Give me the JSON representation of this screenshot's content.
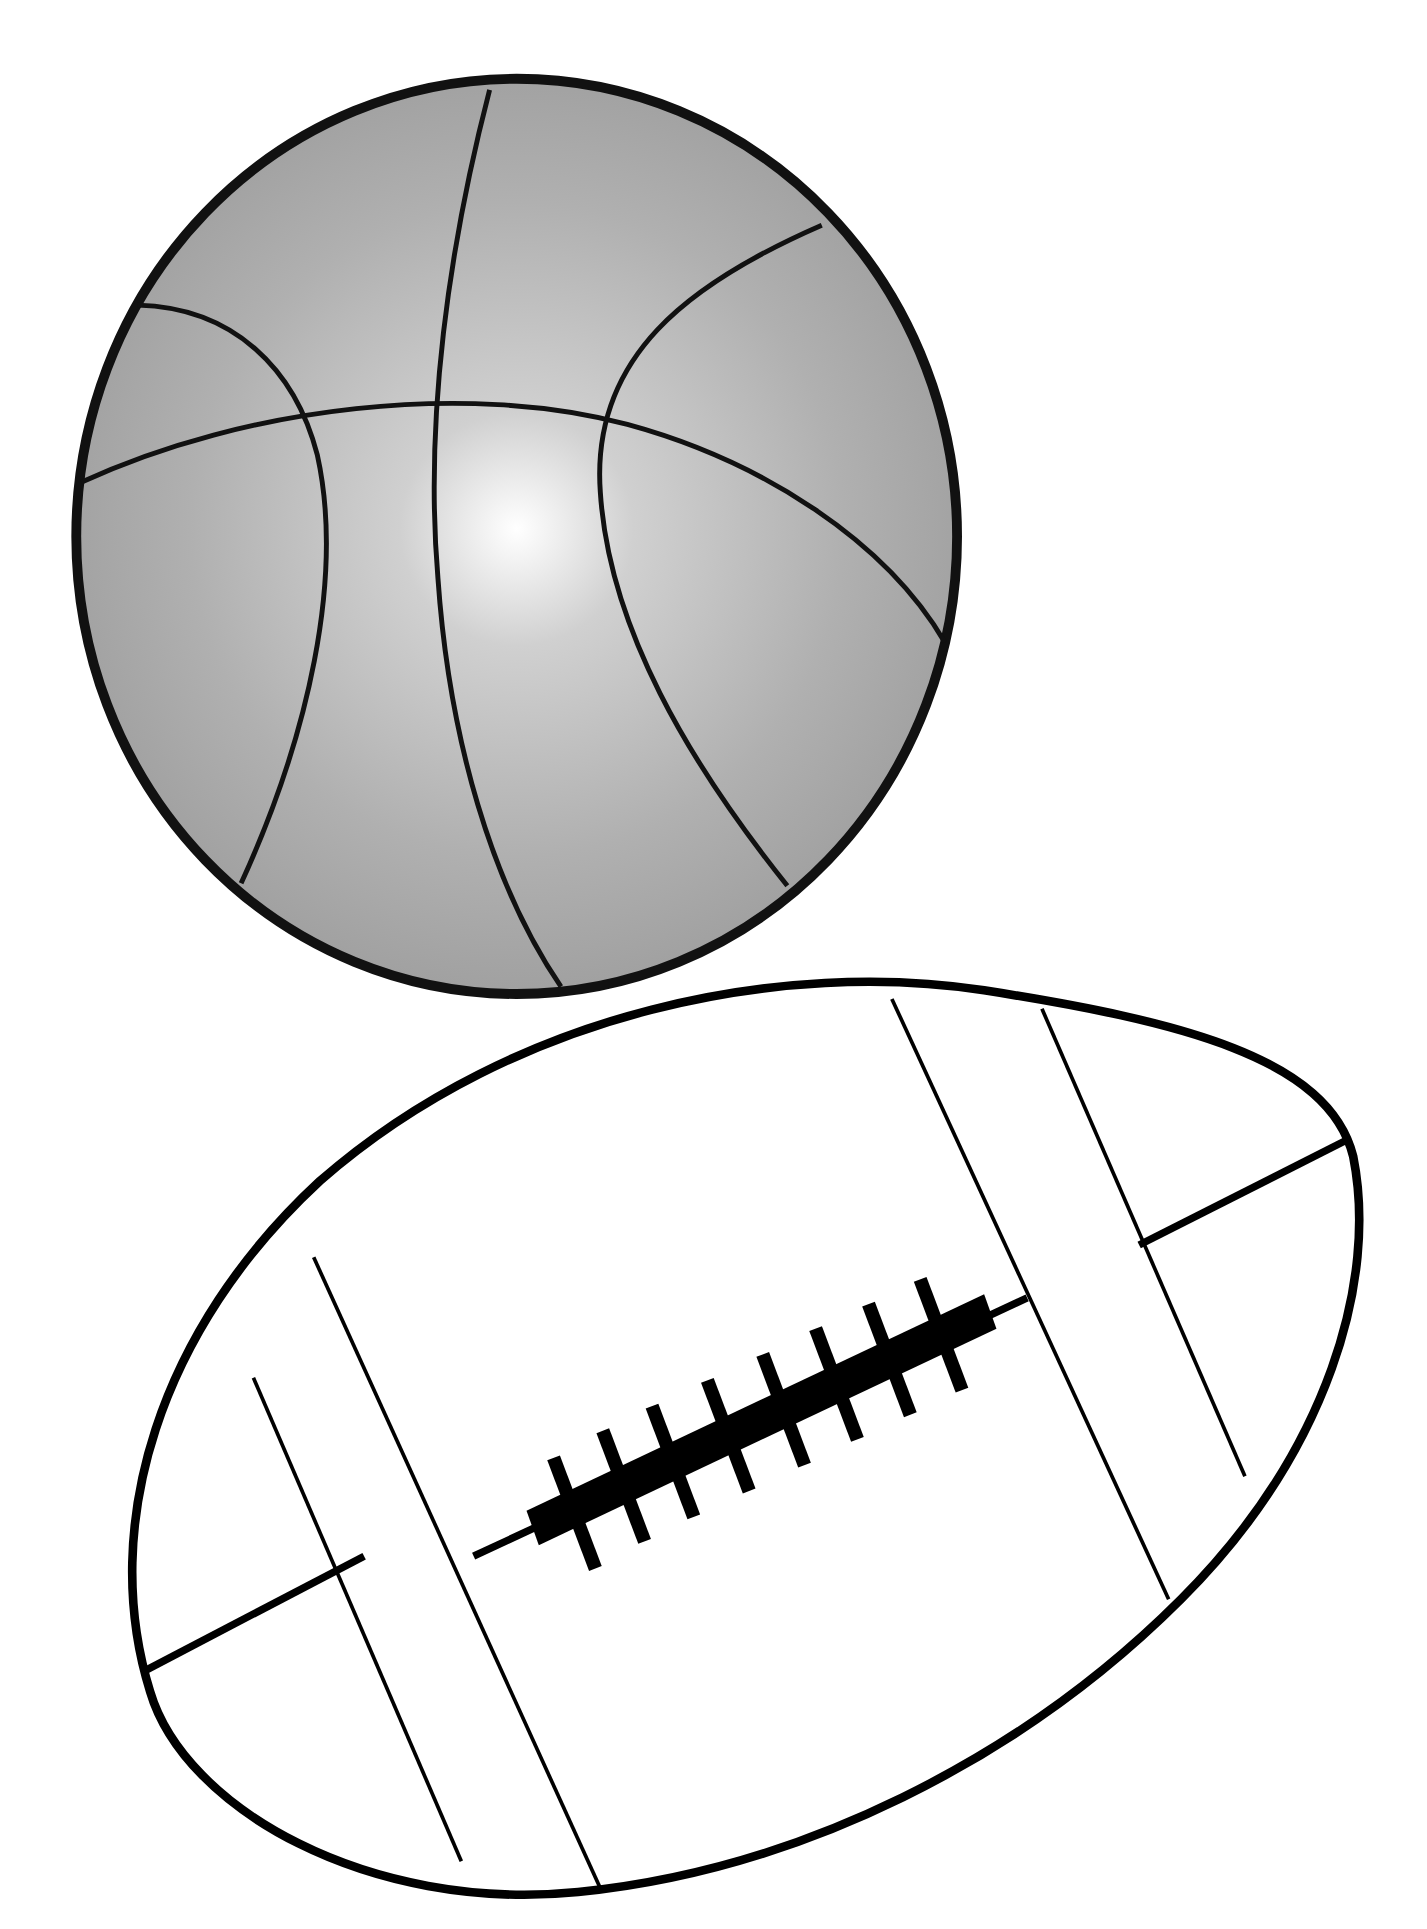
{
  "illustration": {
    "title": "Basketball and football clip art",
    "objects": [
      {
        "name": "basketball",
        "fill": "#a8a8a8",
        "highlight": "#ffffff",
        "stroke": "#111111"
      },
      {
        "name": "football",
        "fill": "#ffffff",
        "stroke": "#000000",
        "laces": 8
      }
    ]
  }
}
